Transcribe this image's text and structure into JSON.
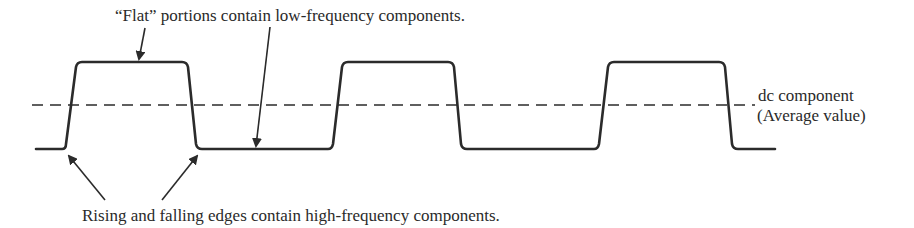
{
  "annotations": {
    "top": "“Flat” portions contain low-frequency components.",
    "bottom": "Rising and falling edges contain high-frequency components.",
    "dc_line1": "dc component",
    "dc_line2": "(Average value)"
  },
  "waveform": {
    "type": "pulse-train",
    "pulses": 3,
    "levels": {
      "low": "low",
      "high": "high",
      "dc": "average value"
    }
  },
  "colors": {
    "ink": "#2b2b2b",
    "background": "#ffffff"
  }
}
